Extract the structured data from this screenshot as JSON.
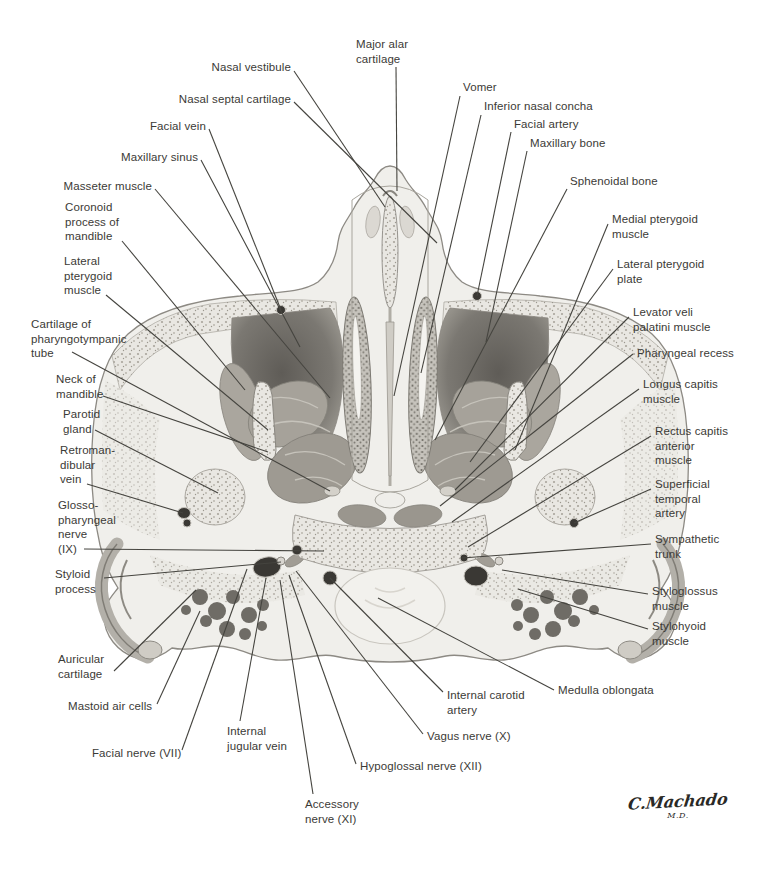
{
  "figure": {
    "signature": "C.Machado",
    "signature_suffix": "M.D.",
    "colors": {
      "ink": "#3b3a36",
      "leader_line": "#45443f",
      "paper": "#ffffff",
      "bone_stipple": "#a8a49b",
      "muscle": "#a3a098",
      "cavity_dark": "#6b6863",
      "vessel_dark": "#3a3834",
      "skin": "#f0efeb"
    }
  },
  "labels": [
    {
      "id": "nasal-vestibule",
      "lines": [
        "Nasal vestibule"
      ],
      "anchor": "right",
      "x": 291,
      "y": 60,
      "leader": [
        294,
        71,
        385,
        207
      ]
    },
    {
      "id": "nasal-septal-cartilage",
      "lines": [
        "Nasal septal cartilage"
      ],
      "anchor": "right",
      "x": 291,
      "y": 92,
      "leader": [
        294,
        102,
        437,
        243
      ]
    },
    {
      "id": "facial-vein",
      "lines": [
        "Facial vein"
      ],
      "anchor": "right",
      "x": 206,
      "y": 119,
      "leader": [
        209,
        129,
        281,
        310
      ]
    },
    {
      "id": "maxillary-sinus",
      "lines": [
        "Maxillary sinus"
      ],
      "anchor": "right",
      "x": 198,
      "y": 150,
      "leader": [
        201,
        160,
        300,
        347
      ]
    },
    {
      "id": "masseter-muscle",
      "lines": [
        "Masseter muscle"
      ],
      "anchor": "right",
      "x": 152,
      "y": 179,
      "leader": [
        155,
        189,
        330,
        398
      ]
    },
    {
      "id": "coronoid-process-of-mandible",
      "lines": [
        "Coronoid",
        "process of",
        "mandible"
      ],
      "anchor": "left",
      "x": 65,
      "y": 200,
      "leader": [
        122,
        241,
        245,
        390
      ]
    },
    {
      "id": "lateral-pterygoid-muscle",
      "lines": [
        "Lateral",
        "pterygoid",
        "muscle"
      ],
      "anchor": "left",
      "x": 64,
      "y": 254,
      "leader": [
        106,
        295,
        268,
        430
      ]
    },
    {
      "id": "cartilage-of-pharyngotympanic-tube",
      "lines": [
        "Cartilage of",
        "pharyngotympanic",
        "tube"
      ],
      "anchor": "left",
      "x": 31,
      "y": 317,
      "leader": [
        72,
        352,
        330,
        491
      ]
    },
    {
      "id": "neck-of-mandible",
      "lines": [
        "Neck of",
        "mandible"
      ],
      "anchor": "left",
      "x": 56,
      "y": 372,
      "leader": [
        103,
        396,
        268,
        452
      ]
    },
    {
      "id": "parotid-gland",
      "lines": [
        "Parotid",
        "gland"
      ],
      "anchor": "left",
      "x": 63,
      "y": 407,
      "leader": [
        95,
        430,
        218,
        493
      ]
    },
    {
      "id": "retromandibular-vein",
      "lines": [
        "Retroman-",
        "dibular",
        "vein"
      ],
      "anchor": "left",
      "x": 60,
      "y": 443,
      "leader": [
        87,
        484,
        183,
        513
      ]
    },
    {
      "id": "glossopharyngeal-nerve-ix",
      "lines": [
        "Glosso-",
        "pharyngeal",
        "nerve",
        "(IX)"
      ],
      "anchor": "left",
      "x": 58,
      "y": 498,
      "leader": [
        84,
        549,
        324,
        551
      ]
    },
    {
      "id": "styloid-process",
      "lines": [
        "Styloid",
        "process"
      ],
      "anchor": "left",
      "x": 55,
      "y": 567,
      "leader": [
        104,
        578,
        281,
        562
      ]
    },
    {
      "id": "auricular-cartilage",
      "lines": [
        "Auricular",
        "cartilage"
      ],
      "anchor": "left",
      "x": 58,
      "y": 652,
      "leader": [
        114,
        671,
        196,
        590
      ]
    },
    {
      "id": "mastoid-air-cells",
      "lines": [
        "Mastoid air cells"
      ],
      "anchor": "left",
      "x": 68,
      "y": 699,
      "leader": [
        157,
        704,
        200,
        611
      ]
    },
    {
      "id": "facial-nerve-vii",
      "lines": [
        "Facial nerve (VII)"
      ],
      "anchor": "left",
      "x": 92,
      "y": 746,
      "leader": [
        182,
        750,
        247,
        569
      ]
    },
    {
      "id": "internal-jugular-vein",
      "lines": [
        "Internal",
        "jugular vein"
      ],
      "anchor": "left",
      "x": 227,
      "y": 724,
      "leader": [
        240,
        721,
        266,
        578
      ]
    },
    {
      "id": "accessory-nerve-xi",
      "lines": [
        "Accessory",
        "nerve (XI)"
      ],
      "anchor": "left",
      "x": 305,
      "y": 797,
      "leader": [
        313,
        794,
        280,
        580
      ]
    },
    {
      "id": "hypoglossal-nerve-xii",
      "lines": [
        "Hypoglossal nerve (XII)"
      ],
      "anchor": "left",
      "x": 360,
      "y": 759,
      "leader": [
        356,
        764,
        289,
        575
      ]
    },
    {
      "id": "vagus-nerve-x",
      "lines": [
        "Vagus nerve (X)"
      ],
      "anchor": "left",
      "x": 427,
      "y": 729,
      "leader": [
        423,
        734,
        296,
        571
      ]
    },
    {
      "id": "internal-carotid-artery",
      "lines": [
        "Internal carotid",
        "artery"
      ],
      "anchor": "left",
      "x": 447,
      "y": 688,
      "leader": [
        443,
        692,
        330,
        578
      ]
    },
    {
      "id": "medulla-oblongata",
      "lines": [
        "Medulla oblongata"
      ],
      "anchor": "left",
      "x": 558,
      "y": 683,
      "leader": [
        554,
        690,
        378,
        598
      ]
    },
    {
      "id": "major-alar-cartilage",
      "lines": [
        "Major alar",
        "cartilage"
      ],
      "anchor": "left",
      "x": 356,
      "y": 37,
      "leader": [
        396,
        67,
        397,
        191
      ]
    },
    {
      "id": "vomer",
      "lines": [
        "Vomer"
      ],
      "anchor": "left",
      "x": 463,
      "y": 80,
      "leader": [
        460,
        96,
        394,
        396
      ]
    },
    {
      "id": "inferior-nasal-concha",
      "lines": [
        "Inferior nasal concha"
      ],
      "anchor": "left",
      "x": 484,
      "y": 99,
      "leader": [
        481,
        115,
        421,
        373
      ]
    },
    {
      "id": "facial-artery",
      "lines": [
        "Facial artery"
      ],
      "anchor": "left",
      "x": 514,
      "y": 117,
      "leader": [
        511,
        132,
        477,
        296
      ]
    },
    {
      "id": "maxillary-bone",
      "lines": [
        "Maxillary bone"
      ],
      "anchor": "left",
      "x": 530,
      "y": 136,
      "leader": [
        527,
        151,
        486,
        342
      ]
    },
    {
      "id": "sphenoidal-bone",
      "lines": [
        "Sphenoidal bone"
      ],
      "anchor": "left",
      "x": 570,
      "y": 174,
      "leader": [
        567,
        189,
        435,
        440
      ]
    },
    {
      "id": "medial-pterygoid-muscle",
      "lines": [
        "Medial pterygoid",
        "muscle"
      ],
      "anchor": "left",
      "x": 612,
      "y": 212,
      "leader": [
        608,
        224,
        515,
        450
      ]
    },
    {
      "id": "lateral-pterygoid-plate",
      "lines": [
        "Lateral pterygoid",
        "plate"
      ],
      "anchor": "left",
      "x": 617,
      "y": 257,
      "leader": [
        613,
        269,
        470,
        462
      ]
    },
    {
      "id": "levator-veli-palatini-muscle",
      "lines": [
        "Levator veli",
        "palatini muscle"
      ],
      "anchor": "left",
      "x": 633,
      "y": 305,
      "leader": [
        629,
        317,
        455,
        490
      ]
    },
    {
      "id": "pharyngeal-recess",
      "lines": [
        "Pharyngeal recess"
      ],
      "anchor": "left",
      "x": 637,
      "y": 346,
      "leader": [
        633,
        354,
        440,
        506
      ]
    },
    {
      "id": "longus-capitis-muscle",
      "lines": [
        "Longus capitis",
        "muscle"
      ],
      "anchor": "left",
      "x": 643,
      "y": 377,
      "leader": [
        639,
        389,
        452,
        522
      ]
    },
    {
      "id": "rectus-capitis-anterior-muscle",
      "lines": [
        "Rectus capitis",
        "anterior",
        "muscle"
      ],
      "anchor": "left",
      "x": 655,
      "y": 424,
      "leader": [
        651,
        436,
        468,
        547
      ]
    },
    {
      "id": "superficial-temporal-artery",
      "lines": [
        "Superficial",
        "temporal",
        "artery"
      ],
      "anchor": "left",
      "x": 655,
      "y": 477,
      "leader": [
        651,
        489,
        574,
        523
      ]
    },
    {
      "id": "sympathetic-trunk",
      "lines": [
        "Sympathetic",
        "trunk"
      ],
      "anchor": "left",
      "x": 655,
      "y": 532,
      "leader": [
        651,
        544,
        462,
        558
      ]
    },
    {
      "id": "styloglossus-muscle",
      "lines": [
        "Styloglossus",
        "muscle"
      ],
      "anchor": "left",
      "x": 652,
      "y": 584,
      "leader": [
        648,
        594,
        502,
        570
      ]
    },
    {
      "id": "stylohyoid-muscle",
      "lines": [
        "Stylohyoid",
        "muscle"
      ],
      "anchor": "left",
      "x": 652,
      "y": 619,
      "leader": [
        648,
        629,
        518,
        589
      ]
    }
  ]
}
